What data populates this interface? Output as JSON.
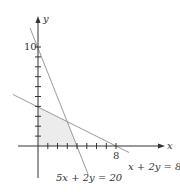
{
  "diagram": {
    "type": "linear-inequality-graph",
    "axes": {
      "x_label": "x",
      "y_label": "y",
      "x_tick_label": "8",
      "y_tick_label": "10",
      "x_ticks": [
        1,
        2,
        3,
        4,
        5,
        6,
        7,
        8
      ],
      "y_ticks": [
        1,
        2,
        3,
        4,
        5,
        6,
        7,
        8,
        9,
        10
      ]
    },
    "lines": [
      {
        "equation": "5x + 2y = 20",
        "label": "5x + 2y = 20",
        "x_intercept": 4,
        "y_intercept": 10
      },
      {
        "equation": "x + 2y = 8",
        "label": "x + 2y = 8",
        "x_intercept": 8,
        "y_intercept": 4
      }
    ],
    "feasible_region": {
      "vertices": [
        [
          0,
          0
        ],
        [
          4,
          0
        ],
        [
          3,
          2.5
        ],
        [
          0,
          4
        ]
      ],
      "fill": "#ececec"
    },
    "colors": {
      "axis": "#333333",
      "line": "#999999",
      "text": "#333333"
    }
  }
}
